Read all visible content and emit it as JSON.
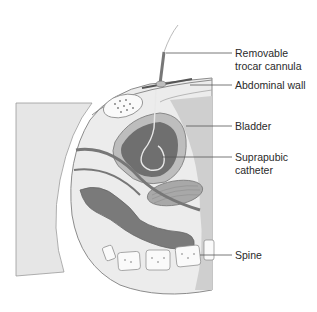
{
  "diagram": {
    "type": "anatomical-cross-section",
    "colors": {
      "background": "#ffffff",
      "tissue_light": "#e9e9e9",
      "tissue_mid": "#bdbdbd",
      "bladder_interior": "#6f6f6f",
      "bowel": "#7a7a7a",
      "leader_line": "#555555",
      "text": "#2a2a2a"
    },
    "labels": [
      {
        "id": "trocar",
        "text": "Removable\ntrocar cannula",
        "line_y": 53,
        "text_top": 47
      },
      {
        "id": "abdominal-wall",
        "text": "Abdominal wall",
        "line_y": 85,
        "text_top": 79
      },
      {
        "id": "bladder",
        "text": "Bladder",
        "line_y": 126,
        "text_top": 120
      },
      {
        "id": "catheter",
        "text": "Suprapubic\ncatheter",
        "line_y": 157,
        "text_top": 151
      },
      {
        "id": "spine",
        "text": "Spine",
        "line_y": 255,
        "text_top": 249
      }
    ]
  }
}
